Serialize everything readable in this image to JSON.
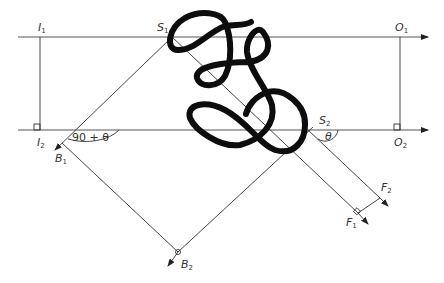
{
  "diagram": {
    "labels": {
      "I1": {
        "main": "I",
        "sub": "1"
      },
      "I2": {
        "main": "I",
        "sub": "2"
      },
      "S1": {
        "main": "S",
        "sub": "1"
      },
      "S2": {
        "main": "S",
        "sub": "2"
      },
      "O1": {
        "main": "O",
        "sub": "1"
      },
      "O2": {
        "main": "O",
        "sub": "2"
      },
      "B1": {
        "main": "B",
        "sub": "1"
      },
      "B2": {
        "main": "B",
        "sub": "2"
      },
      "F1": {
        "main": "F",
        "sub": "1"
      },
      "F2": {
        "main": "F",
        "sub": "2"
      }
    },
    "angles": {
      "left_angle": "90 + θ",
      "right_angle": "θ"
    },
    "colors": {
      "line": "#333333",
      "scribble": "#0d0d0d",
      "background": "#ffffff"
    }
  }
}
